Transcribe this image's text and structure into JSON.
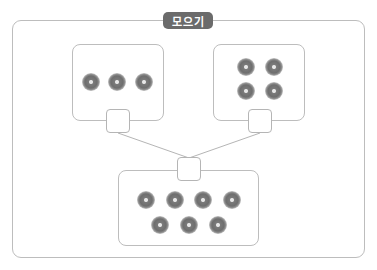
{
  "title": "모으기",
  "colors": {
    "badge_bg": "#6b6b6b",
    "border": "#bdbdbd",
    "coin": "#6e6e6e"
  },
  "groups": [
    {
      "name": "left-group",
      "count": 3
    },
    {
      "name": "right-group",
      "count": 4
    },
    {
      "name": "total-group",
      "count": 7
    }
  ],
  "blanks": [
    {
      "name": "left-answer-box",
      "value": ""
    },
    {
      "name": "right-answer-box",
      "value": ""
    },
    {
      "name": "total-answer-box",
      "value": ""
    }
  ]
}
